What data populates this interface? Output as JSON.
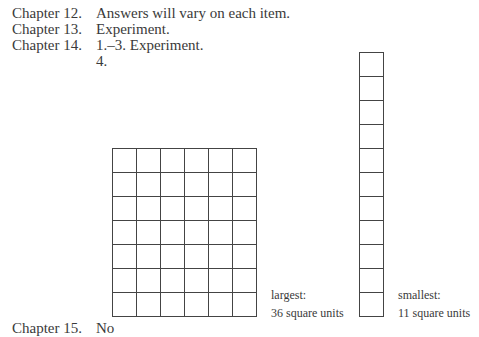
{
  "answers": [
    {
      "chapter": "Chapter 12.",
      "text": "Answers will vary on each item."
    },
    {
      "chapter": "Chapter 13.",
      "text": "Experiment."
    },
    {
      "chapter": "Chapter 14.",
      "text": "1.–3. Experiment."
    },
    {
      "chapter": "",
      "text": "4."
    }
  ],
  "figure": {
    "large": {
      "columns": 6,
      "rows": 7,
      "label_line1": "largest:",
      "label_line2": "36 square units"
    },
    "small": {
      "columns": 1,
      "rows": 11,
      "label_line1": "smallest:",
      "label_line2": "11 square units"
    }
  },
  "cutoff": {
    "chapter": "Chapter 15.",
    "text": "No"
  }
}
